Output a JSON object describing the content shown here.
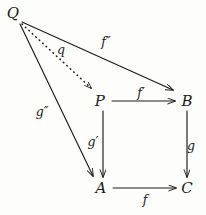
{
  "diagram": {
    "kind": "commutative-diagram",
    "background_color": "#fdfdfc",
    "ink_color": "#1b1b1b",
    "nodes": [
      {
        "id": "Q",
        "label": "Q",
        "x": 13,
        "y": 13
      },
      {
        "id": "P",
        "label": "P",
        "x": 100,
        "y": 101
      },
      {
        "id": "B",
        "label": "B",
        "x": 187,
        "y": 101
      },
      {
        "id": "A",
        "label": "A",
        "x": 101,
        "y": 188
      },
      {
        "id": "C",
        "label": "C",
        "x": 187,
        "y": 188
      }
    ],
    "edges": [
      {
        "id": "f-double-prime",
        "from": "Q",
        "to": "B",
        "style": "solid",
        "label": "f″",
        "label_base": "f",
        "label_primes": "″",
        "label_x": 106,
        "label_y": 41,
        "x1": 22,
        "y1": 22,
        "x2": 173,
        "y2": 90
      },
      {
        "id": "q",
        "from": "Q",
        "to": "P",
        "style": "dotted",
        "label": "q",
        "label_base": "q",
        "label_primes": "",
        "label_x": 61,
        "label_y": 49,
        "x1": 22,
        "y1": 24,
        "x2": 91,
        "y2": 88
      },
      {
        "id": "g-double-prime",
        "from": "Q",
        "to": "A",
        "style": "solid",
        "label": "g″",
        "label_base": "g",
        "label_primes": "″",
        "label_x": 42,
        "label_y": 111,
        "x1": 20,
        "y1": 24,
        "x2": 93,
        "y2": 176
      },
      {
        "id": "f-prime",
        "from": "P",
        "to": "B",
        "style": "solid",
        "label": "f′",
        "label_base": "f",
        "label_primes": "′",
        "label_x": 141,
        "label_y": 92,
        "x1": 112,
        "y1": 101,
        "x2": 175,
        "y2": 101
      },
      {
        "id": "g-prime",
        "from": "P",
        "to": "A",
        "style": "solid",
        "label": "g′",
        "label_base": "g",
        "label_primes": "′",
        "label_x": 93,
        "label_y": 141,
        "x1": 103,
        "y1": 111,
        "x2": 103,
        "y2": 177
      },
      {
        "id": "g",
        "from": "B",
        "to": "C",
        "style": "solid",
        "label": "g",
        "label_base": "g",
        "label_primes": "",
        "label_x": 191,
        "label_y": 145,
        "x1": 187,
        "y1": 111,
        "x2": 187,
        "y2": 177
      },
      {
        "id": "f",
        "from": "A",
        "to": "C",
        "style": "solid",
        "label": "f",
        "label_base": "f",
        "label_primes": "",
        "label_x": 145,
        "label_y": 199,
        "x1": 113,
        "y1": 188,
        "x2": 176,
        "y2": 188
      }
    ]
  }
}
